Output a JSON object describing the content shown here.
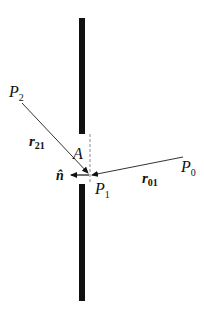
{
  "diagram": {
    "colors": {
      "screen": "#111111",
      "line": "#333333",
      "dashed": "#888888",
      "background": "#ffffff"
    },
    "labels": {
      "p0": {
        "main": "P",
        "sub": "0"
      },
      "p1": {
        "main": "P",
        "sub": "1"
      },
      "p2": {
        "main": "P",
        "sub": "2"
      },
      "r01": {
        "main": "r",
        "sub": "01"
      },
      "r21": {
        "main": "r",
        "sub": "21"
      },
      "aperture": "A",
      "normal": "n̂"
    },
    "elements": {
      "screen_top": {
        "x": 79,
        "y1": 18,
        "y2": 134,
        "width": 6
      },
      "screen_bottom": {
        "x": 79,
        "y1": 184,
        "y2": 301,
        "width": 6
      },
      "aperture_dashed": {
        "x": 90,
        "y1": 134,
        "y2": 184
      },
      "ray_r01": {
        "from": [
          183,
          157
        ],
        "to": [
          91,
          175
        ]
      },
      "ray_r21": {
        "from": [
          22,
          103
        ],
        "to": [
          89,
          174
        ]
      },
      "normal_arrow": {
        "from": [
          89,
          175
        ],
        "to": [
          70,
          175
        ]
      }
    }
  }
}
